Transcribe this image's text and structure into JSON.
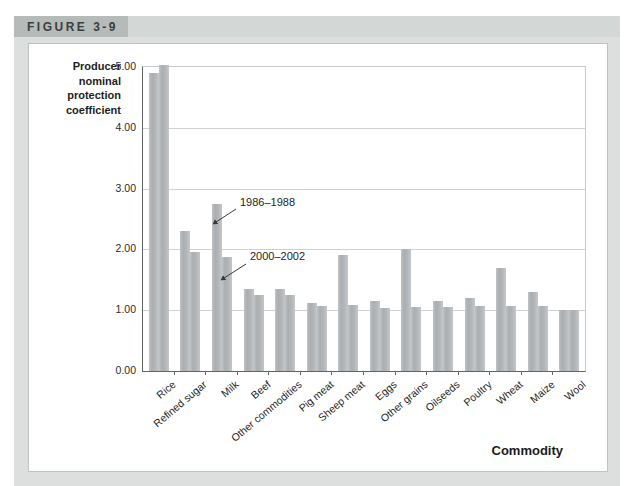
{
  "figure": {
    "label": "FIGURE 3-9"
  },
  "chart_data": {
    "type": "bar",
    "title": "",
    "ylabel": "Producer\nnominal\nprotection\ncoefficient",
    "xlabel": "Commodity",
    "ylim": [
      0,
      5
    ],
    "yticks": [
      "0.00",
      "1.00",
      "2.00",
      "3.00",
      "4.00",
      "5.00"
    ],
    "grid": "horizontal",
    "legend_position": "inline-annotations",
    "categories": [
      "Rice",
      "Refined sugar",
      "Milk",
      "Beef",
      "Other commodities",
      "Pig meat",
      "Sheep meat",
      "Eggs",
      "Other grains",
      "Oilseeds",
      "Poultry",
      "Wheat",
      "Maize",
      "Wool"
    ],
    "series": [
      {
        "name": "1986–1988",
        "values": [
          4.9,
          2.3,
          2.75,
          1.35,
          1.35,
          1.12,
          1.9,
          1.15,
          2.0,
          1.15,
          1.2,
          1.7,
          1.3,
          1.0
        ]
      },
      {
        "name": "2000–2002",
        "values": [
          5.03,
          1.95,
          1.87,
          1.25,
          1.25,
          1.07,
          1.09,
          1.03,
          1.05,
          1.05,
          1.07,
          1.07,
          1.07,
          1.0
        ]
      }
    ],
    "annotations": [
      {
        "text": "1986–1988",
        "x": 211,
        "y": 152,
        "line": [
          207,
          165,
          184,
          180
        ]
      },
      {
        "text": "2000–2002",
        "x": 221,
        "y": 206,
        "line": [
          217,
          220,
          192,
          236
        ]
      }
    ],
    "bar_color": "#b1b5b7"
  },
  "colors": {
    "panel_bg": "#dcdfde",
    "header_band": "#d3d7d6",
    "header_box": "#b6bab9",
    "gridline": "#ced2d1",
    "axis": "#5f6464"
  }
}
